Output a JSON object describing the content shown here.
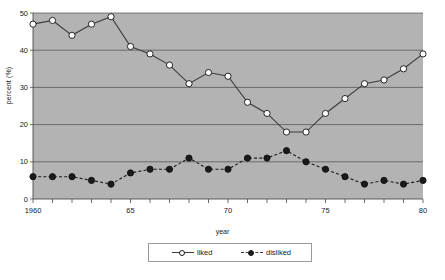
{
  "chart_data": {
    "type": "line",
    "title": "",
    "xlabel": "year",
    "ylabel": "percent (%)",
    "x": [
      1960,
      1961,
      1962,
      1963,
      1964,
      1965,
      1966,
      1967,
      1968,
      1969,
      1970,
      1971,
      1972,
      1973,
      1974,
      1975,
      1976,
      1977,
      1978,
      1979,
      1980
    ],
    "xlim": [
      1960,
      1980
    ],
    "ylim": [
      0,
      50
    ],
    "yticks": [
      0,
      10,
      20,
      30,
      40,
      50
    ],
    "ytick_labels": [
      "0",
      "10",
      "20",
      "30",
      "40",
      "50"
    ],
    "xticks": [
      1960,
      1965,
      1970,
      1975,
      1980
    ],
    "xtick_labels": [
      "1960",
      "65",
      "70",
      "75",
      "80"
    ],
    "grid": "horizontal",
    "legend_position": "bottom-center",
    "plot_background": "#b3b3b3",
    "series": [
      {
        "name": "liked",
        "marker": "open-circle",
        "line_style": "solid",
        "color": "#3c3c3c",
        "marker_fill": "#ffffff",
        "values": [
          47,
          48,
          44,
          47,
          49,
          41,
          39,
          36,
          31,
          34,
          33,
          26,
          23,
          18,
          18,
          23,
          27,
          31,
          32,
          35,
          39
        ]
      },
      {
        "name": "disliked",
        "marker": "filled-circle",
        "line_style": "dashed",
        "color": "#1a1a1a",
        "marker_fill": "#1a1a1a",
        "values": [
          6,
          6,
          6,
          5,
          4,
          7,
          8,
          8,
          11,
          8,
          8,
          11,
          11,
          13,
          10,
          8,
          6,
          4,
          5,
          4,
          5
        ]
      }
    ]
  },
  "legend": {
    "items": [
      {
        "label": "liked"
      },
      {
        "label": "disliked"
      }
    ]
  }
}
